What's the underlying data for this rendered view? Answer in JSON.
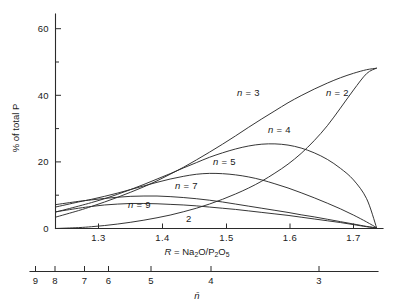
{
  "figure": {
    "y_axis": {
      "label": "% of total P",
      "ticks": [
        "0",
        "20",
        "40",
        "60"
      ],
      "tick_values": [
        0,
        20,
        40,
        60
      ],
      "minor_tick_values": [
        10,
        30,
        50,
        70
      ],
      "range": [
        0,
        72
      ]
    },
    "x_axis": {
      "label_prefix": "R",
      "label_eq": " = Na",
      "label_sub1": "2",
      "label_mid": "O/P",
      "label_sub2": "2",
      "label_mid2": "O",
      "label_sub3": "5",
      "label_full": "R = Na2O/P2O5",
      "ticks": [
        "1.3",
        "1.4",
        "1.5",
        "1.6",
        "1.7"
      ],
      "tick_values": [
        1.3,
        1.4,
        1.5,
        1.6,
        1.7
      ],
      "range": [
        1.245,
        1.745
      ]
    },
    "secondary_axis": {
      "label": "n̄",
      "ticks": [
        "9",
        "8",
        "7",
        "6",
        "5",
        "4",
        "3"
      ],
      "tick_values": [
        9,
        8,
        7,
        6,
        5,
        4,
        3
      ],
      "tick_positions_r": [
        1.2605,
        1.2755,
        1.2985,
        1.3175,
        1.3505,
        1.3975,
        1.5665
      ]
    },
    "curve_labels": [
      {
        "text": "n = 3",
        "x": 237,
        "y": 96
      },
      {
        "text": "n = 2",
        "x": 326,
        "y": 96
      },
      {
        "text": "n = 4",
        "x": 268,
        "y": 133
      },
      {
        "text": "n = 5",
        "x": 213,
        "y": 165
      },
      {
        "text": "n = 7",
        "x": 175,
        "y": 189
      },
      {
        "text": "n = 9",
        "x": 128,
        "y": 208
      },
      {
        "text": "2",
        "x": 186,
        "y": 222
      }
    ],
    "colors": {
      "ink": "#2b2b2b",
      "background": "#ffffff"
    }
  },
  "chart_data": {
    "type": "line",
    "title": "",
    "xlabel": "R = Na2O/P2O5",
    "ylabel": "% of total P",
    "xlim": [
      1.245,
      1.745
    ],
    "ylim": [
      0,
      72
    ],
    "grid": false,
    "legend": "inline-curve-labels",
    "secondary_xlabel": "n̄",
    "x": [
      1.245,
      1.28,
      1.3,
      1.32,
      1.34,
      1.36,
      1.38,
      1.4,
      1.42,
      1.44,
      1.46,
      1.48,
      1.5,
      1.52,
      1.54,
      1.56,
      1.58,
      1.6,
      1.62,
      1.64,
      1.66,
      1.68,
      1.7,
      1.72,
      1.735
    ],
    "series": [
      {
        "name": "n = 2",
        "label": "n = 2",
        "values": [
          0.0,
          0.3,
          0.6,
          1.0,
          1.5,
          2.1,
          2.8,
          3.6,
          4.5,
          5.6,
          6.8,
          8.2,
          9.8,
          11.6,
          13.6,
          15.9,
          18.6,
          21.6,
          25.2,
          29.5,
          34.5,
          40.4,
          46.5,
          52.0,
          53.8
        ]
      },
      {
        "name": "n = 3",
        "label": "n = 3",
        "values": [
          3.8,
          6.0,
          7.4,
          8.9,
          10.5,
          12.2,
          14.0,
          16.0,
          18.2,
          20.5,
          23.0,
          25.6,
          28.3,
          31.1,
          34.0,
          36.8,
          39.5,
          42.2,
          44.6,
          46.8,
          48.8,
          50.6,
          52.1,
          53.3,
          53.8
        ]
      },
      {
        "name": "n = 4",
        "label": "n = 4",
        "values": [
          5.5,
          7.5,
          8.7,
          10.0,
          11.5,
          13.1,
          14.8,
          16.6,
          18.4,
          20.3,
          22.1,
          23.9,
          25.4,
          26.7,
          27.7,
          28.3,
          28.4,
          28.0,
          27.0,
          25.4,
          23.2,
          20.2,
          16.3,
          10.0,
          0.4
        ]
      },
      {
        "name": "n = 5",
        "label": "n = 5",
        "values": [
          7.2,
          8.9,
          9.8,
          10.8,
          11.9,
          13.1,
          14.3,
          15.5,
          16.6,
          17.5,
          18.2,
          18.5,
          18.4,
          18.0,
          17.3,
          16.3,
          15.0,
          13.6,
          12.0,
          10.3,
          8.5,
          6.6,
          4.5,
          2.2,
          0.3
        ]
      },
      {
        "name": "n = 7",
        "label": "n = 7",
        "values": [
          8.0,
          9.1,
          9.6,
          10.1,
          10.5,
          10.8,
          10.9,
          10.9,
          10.7,
          10.4,
          10.0,
          9.5,
          8.9,
          8.2,
          7.5,
          6.8,
          6.1,
          5.4,
          4.6,
          3.9,
          3.1,
          2.3,
          1.5,
          0.7,
          0.2
        ]
      },
      {
        "name": "n = 9",
        "label": "n = 9",
        "values": [
          5.6,
          6.8,
          7.4,
          7.9,
          8.2,
          8.4,
          8.4,
          8.3,
          8.1,
          7.9,
          7.6,
          7.2,
          6.8,
          6.4,
          5.9,
          5.4,
          4.9,
          4.4,
          3.8,
          3.2,
          2.6,
          2.0,
          1.3,
          0.6,
          0.2
        ]
      }
    ]
  }
}
